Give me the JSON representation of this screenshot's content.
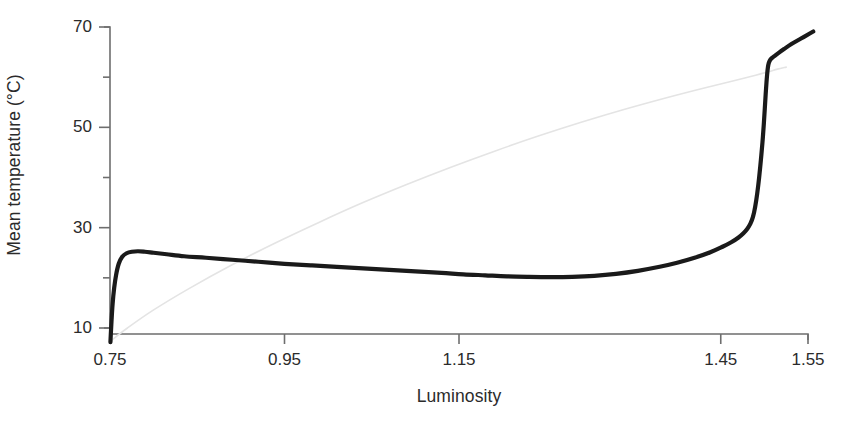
{
  "figure": {
    "background_color": "#ffffff",
    "width": 849,
    "height": 435
  },
  "chart_data": {
    "type": "line",
    "title": "",
    "xlabel": "Luminosity",
    "ylabel": "Mean temperature (°C)",
    "xlim": [
      0.75,
      1.55
    ],
    "ylim": [
      5.0,
      73.0
    ],
    "grid": false,
    "legend_position": "none",
    "x_ticks": [
      {
        "value": 0.75,
        "label": "0.75"
      },
      {
        "value": 0.95,
        "label": "0.95"
      },
      {
        "value": 1.15,
        "label": "1.15"
      },
      {
        "value": 1.45,
        "label": "1.45"
      },
      {
        "value": 1.55,
        "label": "1.55"
      }
    ],
    "y_ticks_major": [
      {
        "value": 70,
        "label": "70"
      },
      {
        "value": 50,
        "label": "50"
      },
      {
        "value": 30,
        "label": "30"
      },
      {
        "value": 10,
        "label": "10"
      }
    ],
    "y_ticks_minor": [
      60,
      40,
      20
    ],
    "series": [
      {
        "name": "mean-temperature",
        "style": "solid",
        "color": "#1a1a1a",
        "line_width": 4.2,
        "x": [
          0.7505,
          0.751,
          0.7518,
          0.753,
          0.7548,
          0.757,
          0.76,
          0.764,
          0.769,
          0.775,
          0.782,
          0.79,
          0.8,
          0.815,
          0.835,
          0.86,
          0.89,
          0.92,
          0.95,
          0.98,
          1.01,
          1.04,
          1.07,
          1.1,
          1.13,
          1.155,
          1.18,
          1.205,
          1.23,
          1.255,
          1.28,
          1.305,
          1.33,
          1.355,
          1.38,
          1.4,
          1.42,
          1.438,
          1.452,
          1.462,
          1.47,
          1.476,
          1.4805,
          1.484,
          1.487,
          1.4895,
          1.4918,
          1.494,
          1.496,
          1.4978,
          1.4993,
          1.5005,
          1.5015,
          1.5024,
          1.5032,
          1.504,
          1.505,
          1.5065,
          1.5085,
          1.5115,
          1.516,
          1.5225,
          1.531,
          1.542,
          1.552,
          1.556
        ],
        "y": [
          7.2,
          9.0,
          11.6,
          14.8,
          18.0,
          20.6,
          22.8,
          24.2,
          24.9,
          25.2,
          25.3,
          25.2,
          25.0,
          24.7,
          24.3,
          24.0,
          23.6,
          23.2,
          22.8,
          22.5,
          22.2,
          21.9,
          21.6,
          21.3,
          21.0,
          20.7,
          20.5,
          20.3,
          20.2,
          20.15,
          20.2,
          20.4,
          20.8,
          21.4,
          22.2,
          23.0,
          24.0,
          25.1,
          26.2,
          27.1,
          28.0,
          28.9,
          29.8,
          30.8,
          32.2,
          34.2,
          36.8,
          40.0,
          43.5,
          47.0,
          50.5,
          53.8,
          56.6,
          58.9,
          60.6,
          61.9,
          62.8,
          63.4,
          63.8,
          64.2,
          64.8,
          65.6,
          66.6,
          67.7,
          68.7,
          69.1
        ]
      },
      {
        "name": "reference-trend",
        "style": "faint",
        "color": "#e4e4e4",
        "line_width": 1.6,
        "x": [
          0.752,
          0.77,
          0.8,
          0.84,
          0.89,
          0.94,
          0.99,
          1.04,
          1.09,
          1.14,
          1.19,
          1.24,
          1.29,
          1.34,
          1.39,
          1.43,
          1.465,
          1.49,
          1.505,
          1.515,
          1.525
        ],
        "y": [
          7.6,
          10.0,
          13.6,
          17.8,
          22.6,
          27.0,
          31.1,
          35.0,
          38.6,
          42.0,
          45.2,
          48.2,
          51.0,
          53.6,
          56.0,
          57.8,
          59.3,
          60.4,
          61.1,
          61.6,
          62.0
        ]
      }
    ]
  },
  "axis_style": {
    "spine_color": "#6e6e6e",
    "spine_width": 1.6,
    "tick_color": "#6e6e6e"
  }
}
